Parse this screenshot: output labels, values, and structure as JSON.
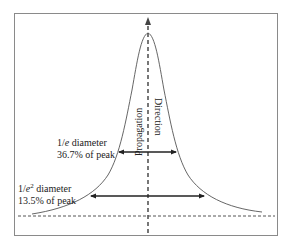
{
  "diagram": {
    "type": "gaussian-beam-profile",
    "axis_label": {
      "line1": "Propagation",
      "line2": "Direction"
    },
    "annotations": [
      {
        "id": "one-over-e",
        "label_prefix": "1/",
        "label_var": "e",
        "label_suffix": " diameter",
        "percent_text": "36.7% of peak"
      },
      {
        "id": "one-over-e-squared",
        "label_prefix": "1/",
        "label_var": "e",
        "label_exp": "2",
        "label_suffix": " diameter",
        "percent_text": "13.5% of peak"
      }
    ],
    "colors": {
      "curve": "#555555",
      "frame": "#8a8a8a",
      "dashed": "#555555",
      "arrow": "#222222",
      "text": "#222222"
    }
  }
}
